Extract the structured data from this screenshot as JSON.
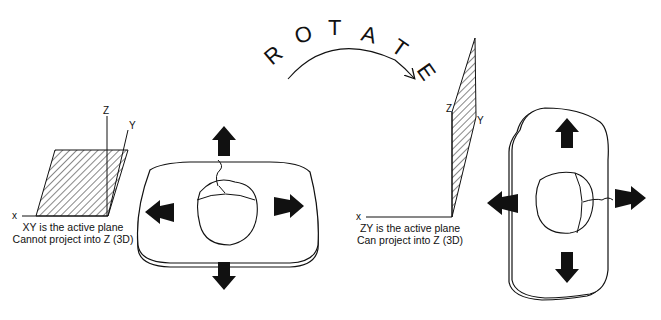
{
  "diagram": {
    "rotate_label": "ROTATE",
    "rotate_letters": [
      "R",
      "O",
      "T",
      "A",
      "T",
      "E"
    ],
    "left_panel": {
      "axes": {
        "x": "x",
        "y": "Y",
        "z": "Z"
      },
      "caption_line1": "XY is the active plane",
      "caption_line2": "Cannot project into Z (3D)",
      "device": "mouse-on-horizontal-pad",
      "arrows": [
        "up",
        "down",
        "left",
        "right"
      ]
    },
    "right_panel": {
      "axes": {
        "x": "x",
        "y": "Y",
        "z": "Z"
      },
      "caption_line1": "ZY is the active plane",
      "caption_line2": "Can project into Z (3D)",
      "device": "mouse-on-vertical-pad",
      "arrows": [
        "up",
        "down",
        "left",
        "right"
      ]
    },
    "colors": {
      "ink": "#111111",
      "background": "#ffffff"
    }
  }
}
